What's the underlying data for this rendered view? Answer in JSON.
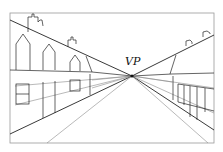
{
  "diagram": {
    "type": "one-point perspective drawing",
    "vanishing_point_label": "VP",
    "colors": {
      "frame": "#9a9a9a",
      "line": "#222222",
      "construction": "#8a8a8a"
    }
  }
}
